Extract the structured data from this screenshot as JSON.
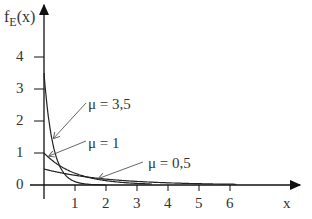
{
  "chart_data": {
    "type": "line",
    "title": "",
    "xlabel": "x",
    "ylabel": "f_E(x)",
    "ylabel_main": "f",
    "ylabel_sub": "E",
    "ylabel_arg": "(x)",
    "xlim": [
      0,
      7
    ],
    "ylim": [
      0,
      5
    ],
    "x_ticks": [
      1,
      2,
      3,
      4,
      5,
      6
    ],
    "x_tick_labels": [
      "1",
      "2",
      "3",
      "4",
      "5",
      "6"
    ],
    "y_ticks": [
      0,
      1,
      2,
      3,
      4
    ],
    "y_tick_labels": [
      "0",
      "1",
      "2",
      "3",
      "4"
    ],
    "grid": false,
    "legend": "annotations with arrows",
    "series": [
      {
        "name": "μ = 3,5",
        "mu": 3.5,
        "formula": "mu*exp(-mu*x)",
        "x_max": 2.0,
        "points": [
          [
            0,
            3.5
          ],
          [
            0.1,
            2.47
          ],
          [
            0.2,
            1.74
          ],
          [
            0.3,
            1.22
          ],
          [
            0.5,
            0.61
          ],
          [
            0.75,
            0.25
          ],
          [
            1,
            0.11
          ],
          [
            1.5,
            0.02
          ],
          [
            2,
            0.003
          ]
        ]
      },
      {
        "name": "μ = 1",
        "mu": 1,
        "formula": "mu*exp(-mu*x)",
        "x_max": 3.5,
        "points": [
          [
            0,
            1
          ],
          [
            0.25,
            0.78
          ],
          [
            0.5,
            0.61
          ],
          [
            1,
            0.37
          ],
          [
            1.5,
            0.22
          ],
          [
            2,
            0.14
          ],
          [
            3,
            0.05
          ],
          [
            3.5,
            0.03
          ]
        ]
      },
      {
        "name": "μ = 0,5",
        "mu": 0.5,
        "formula": "mu*exp(-mu*x)",
        "x_max": 6.2,
        "points": [
          [
            0,
            0.5
          ],
          [
            0.5,
            0.39
          ],
          [
            1,
            0.3
          ],
          [
            2,
            0.18
          ],
          [
            3,
            0.11
          ],
          [
            4,
            0.07
          ],
          [
            5,
            0.04
          ],
          [
            6,
            0.02
          ]
        ]
      }
    ],
    "annotations": [
      {
        "text": "μ = 3,5",
        "arrow_to": [
          0.25,
          1.5
        ]
      },
      {
        "text": "μ = 1",
        "arrow_to": [
          0.15,
          0.85
        ]
      },
      {
        "text": "μ = 0,5",
        "arrow_to": [
          1.8,
          0.17
        ]
      }
    ]
  }
}
